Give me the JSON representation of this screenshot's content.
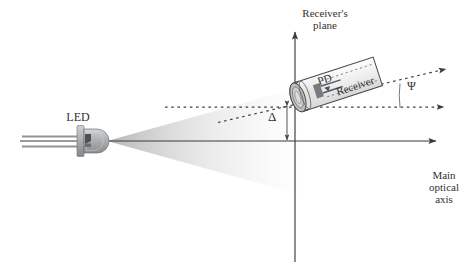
{
  "figure": {
    "background": "#ffffff",
    "width": 472,
    "height": 265
  },
  "labels": {
    "receiver_plane": "Receiver's\nplane",
    "main_optical_axis": "Main\noptical\naxis",
    "led": "LED",
    "delta": "Δ",
    "psi": "Ψ",
    "pd": "PD",
    "receiver": "Receiver"
  },
  "colors": {
    "stroke": "#3a3a38",
    "text": "#33322f",
    "beam_near": "#b9b9b9",
    "beam_far": "#ffffff",
    "led_body": "#b0b2b4",
    "led_body_dark": "#8c8f92",
    "led_lead": "#9a9a9a",
    "tube_body": "#f2f2f2",
    "tube_cap": "#c8c8c8",
    "tube_outline": "#4a4a48",
    "dash": "#3f3f3d"
  },
  "geometry": {
    "main_axis": {
      "x1": 20,
      "y1": 141,
      "x2": 440,
      "y2": 141,
      "arrow": "right"
    },
    "receiver_plane_axis": {
      "x": 295,
      "y_top": 28,
      "y_bottom": 262,
      "arrow": "up"
    },
    "led": {
      "tip_x": 107,
      "center_y": 141,
      "label_x": 78,
      "label_y": 120
    },
    "beam": {
      "apex_x": 107,
      "apex_y": 141,
      "end_x": 300,
      "half_angle_deg": 16
    },
    "receiver_tube": {
      "tilt_deg": -18,
      "cap_x": 296,
      "cap_y": 98,
      "length": 88,
      "width": 30
    },
    "offset_delta": {
      "x": 287,
      "y_top": 106,
      "y_bottom": 140
    },
    "tilt_angle_psi": {
      "vertex_x": 296,
      "vertex_y": 107,
      "arc_radius": 96
    },
    "dashed_axis_ray": {
      "x1": 165,
      "y1": 107,
      "x2": 452,
      "y2": 107
    },
    "dashed_tilt_ray": {
      "x1": 218,
      "y1": 122,
      "x2": 452,
      "y2": 68
    }
  },
  "elements": [
    {
      "name": "led-emitter",
      "kind": "component"
    },
    {
      "name": "light-beam-cone",
      "kind": "beam"
    },
    {
      "name": "receiver-tube",
      "kind": "component"
    },
    {
      "name": "photodiode",
      "kind": "component"
    },
    {
      "name": "main-optical-axis",
      "kind": "axis"
    },
    {
      "name": "receivers-plane-axis",
      "kind": "axis"
    },
    {
      "name": "offset-dimension",
      "kind": "dimension"
    },
    {
      "name": "incidence-angle",
      "kind": "annotation"
    }
  ]
}
